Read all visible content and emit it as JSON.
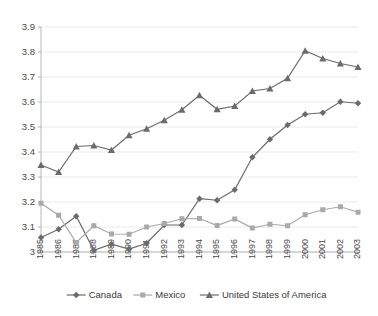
{
  "chart_data": {
    "type": "line",
    "title": "",
    "subtitle": "",
    "xlabel": "",
    "ylabel": "",
    "x": [
      1985,
      1986,
      1987,
      1988,
      1989,
      1990,
      1991,
      1992,
      1993,
      1994,
      1995,
      1996,
      1997,
      1998,
      1999,
      2000,
      2001,
      2002,
      2003
    ],
    "categories": [
      "1985",
      "1986",
      "1987",
      "1988",
      "1989",
      "1990",
      "1991",
      "1992",
      "1993",
      "1994",
      "1995",
      "1996",
      "1997",
      "1998",
      "1999",
      "2000",
      "2001",
      "2002",
      "2003"
    ],
    "ylim": [
      3.0,
      3.9
    ],
    "ytick_values": [
      3.0,
      3.1,
      3.2,
      3.3,
      3.4,
      3.5,
      3.6,
      3.7,
      3.8,
      3.9
    ],
    "ytick_labels": [
      "3",
      "3.1",
      "3.2",
      "3.3",
      "3.4",
      "3.5",
      "3.6",
      "3.7",
      "3.8",
      "3.9"
    ],
    "grid": true,
    "grid_axis": "y",
    "legend_position": "bottom",
    "series": [
      {
        "name": "Canada",
        "marker": "diamond",
        "color": "#6b6b6b",
        "values": [
          3.058,
          3.091,
          3.143,
          3.007,
          3.031,
          3.012,
          3.035,
          3.108,
          3.108,
          3.213,
          3.207,
          3.249,
          3.379,
          3.451,
          3.508,
          3.551,
          3.557,
          3.601,
          3.595
        ]
      },
      {
        "name": "Mexico",
        "marker": "square",
        "color": "#a9a9a9",
        "values": [
          3.195,
          3.147,
          3.038,
          3.105,
          3.072,
          3.071,
          3.1,
          3.114,
          3.133,
          3.134,
          3.106,
          3.132,
          3.096,
          3.111,
          3.105,
          3.149,
          3.169,
          3.181,
          3.159
        ]
      },
      {
        "name": "United States of America",
        "marker": "triangle",
        "color": "#6b6b6b",
        "values": [
          3.348,
          3.32,
          3.422,
          3.426,
          3.408,
          3.467,
          3.493,
          3.527,
          3.569,
          3.627,
          3.571,
          3.584,
          3.644,
          3.654,
          3.695,
          3.805,
          3.774,
          3.754,
          3.74
        ]
      }
    ]
  },
  "legend": {
    "items": [
      {
        "label": "Canada",
        "marker": "diamond",
        "color": "#6b6b6b"
      },
      {
        "label": "Mexico",
        "marker": "square",
        "color": "#a9a9a9"
      },
      {
        "label": "United States of America",
        "marker": "triangle",
        "color": "#6b6b6b"
      }
    ]
  },
  "colors": {
    "background": "#ffffff",
    "grid": "#eceaec",
    "axis": "#b8b8b8",
    "text": "#4a4a4a",
    "canada": "#6b6b6b",
    "mexico": "#a9a9a9",
    "usa": "#6b6b6b"
  }
}
